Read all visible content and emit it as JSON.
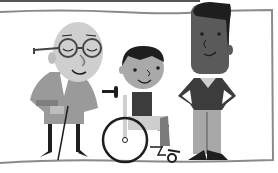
{
  "illustration": {
    "subject": "Three people: elderly man with glasses and cane, child in wheelchair, tall man",
    "style": "grayscale flat cartoon",
    "colors": {
      "background": "#ffffff",
      "frame": "#8a8a8a",
      "skin_light": "#cfcfcf",
      "skin_mid": "#a9a9a9",
      "skin_dark": "#5a5a5a",
      "dark": "#1e1e1e",
      "cardigan": "#9a9a9a",
      "sweater": "#3c3c3c",
      "pants_light": "#a8a8a8"
    },
    "figures": [
      {
        "name": "elderly-man",
        "features": [
          "round glasses",
          "bald",
          "closed eyes smile",
          "cane"
        ]
      },
      {
        "name": "child-in-wheelchair",
        "features": [
          "dark hair",
          "smiling",
          "wheelchair"
        ]
      },
      {
        "name": "tall-man",
        "features": [
          "dark flat-top hair",
          "v-neck sweater",
          "hands on hips"
        ]
      }
    ]
  }
}
